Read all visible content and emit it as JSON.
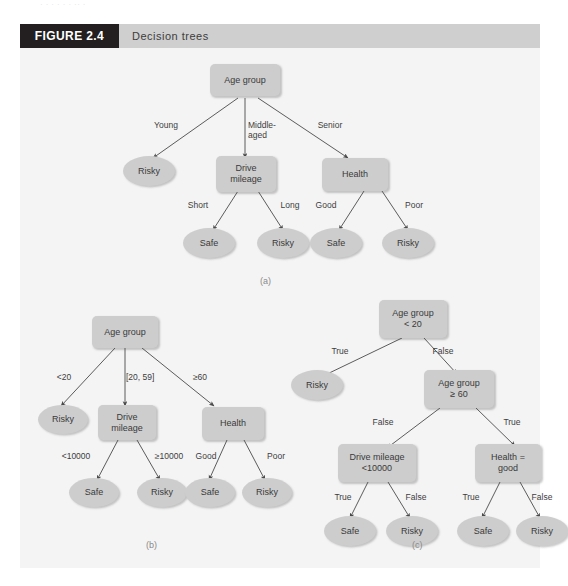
{
  "page": {
    "top_partial_text": "· · ·  ·  · ·   ·· ·"
  },
  "figure": {
    "tag": "FIGURE 2.4",
    "caption": "Decision trees",
    "tag_bg": "#231f20",
    "tag_fg": "#ffffff",
    "bar_bg": "#cfcfcf",
    "body_bg": "#f4f4f4",
    "node_fill": "#cdcdcd",
    "node_text": "#3a3a3a",
    "edge_color": "#4a4a4a"
  },
  "trees": [
    {
      "id": "a",
      "caption": "(a)",
      "nodes": [
        {
          "name": "root",
          "label": "Age group",
          "shape": "rect"
        },
        {
          "name": "risky-young",
          "label": "Risky",
          "shape": "leaf"
        },
        {
          "name": "drive-mileage",
          "label": "Drive\nmileage",
          "shape": "rect"
        },
        {
          "name": "health",
          "label": "Health",
          "shape": "rect"
        },
        {
          "name": "safe-short",
          "label": "Safe",
          "shape": "leaf"
        },
        {
          "name": "risky-long",
          "label": "Risky",
          "shape": "leaf"
        },
        {
          "name": "safe-good",
          "label": "Safe",
          "shape": "leaf"
        },
        {
          "name": "risky-poor",
          "label": "Risky",
          "shape": "leaf"
        }
      ],
      "edge_labels": [
        {
          "name": "young",
          "label": "Young"
        },
        {
          "name": "middle",
          "label": "Middle-\naged"
        },
        {
          "name": "senior",
          "label": "Senior"
        },
        {
          "name": "short",
          "label": "Short"
        },
        {
          "name": "long",
          "label": "Long"
        },
        {
          "name": "good",
          "label": "Good"
        },
        {
          "name": "poor",
          "label": "Poor"
        }
      ]
    },
    {
      "id": "b",
      "caption": "(b)",
      "nodes": [
        {
          "name": "root",
          "label": "Age group",
          "shape": "rect"
        },
        {
          "name": "risky-young",
          "label": "Risky",
          "shape": "leaf"
        },
        {
          "name": "drive-mileage",
          "label": "Drive\nmileage",
          "shape": "rect"
        },
        {
          "name": "health",
          "label": "Health",
          "shape": "rect"
        },
        {
          "name": "safe-low",
          "label": "Safe",
          "shape": "leaf"
        },
        {
          "name": "risky-high",
          "label": "Risky",
          "shape": "leaf"
        },
        {
          "name": "safe-good",
          "label": "Safe",
          "shape": "leaf"
        },
        {
          "name": "risky-poor",
          "label": "Risky",
          "shape": "leaf"
        }
      ],
      "edge_labels": [
        {
          "name": "under20",
          "label": "<20"
        },
        {
          "name": "range2059",
          "label": "[20, 59]"
        },
        {
          "name": "over60",
          "label": "≥60"
        },
        {
          "name": "under10000",
          "label": "<10000"
        },
        {
          "name": "over10000",
          "label": "≥10000"
        },
        {
          "name": "good",
          "label": "Good"
        },
        {
          "name": "poor",
          "label": "Poor"
        }
      ]
    },
    {
      "id": "c",
      "caption": "(c)",
      "nodes": [
        {
          "name": "root",
          "label": "Age group\n< 20",
          "shape": "rect"
        },
        {
          "name": "risky-true",
          "label": "Risky",
          "shape": "leaf"
        },
        {
          "name": "age-60",
          "label": "Age group\n≥ 60",
          "shape": "rect"
        },
        {
          "name": "drive-mileage",
          "label": "Drive mileage\n<10000",
          "shape": "rect"
        },
        {
          "name": "health-good",
          "label": "Health =\ngood",
          "shape": "rect"
        },
        {
          "name": "safe-left",
          "label": "Safe",
          "shape": "leaf"
        },
        {
          "name": "risky-left",
          "label": "Risky",
          "shape": "leaf"
        },
        {
          "name": "safe-right",
          "label": "Safe",
          "shape": "leaf"
        },
        {
          "name": "risky-right",
          "label": "Risky",
          "shape": "leaf"
        }
      ],
      "edge_labels": [
        {
          "name": "root-true",
          "label": "True"
        },
        {
          "name": "root-false",
          "label": "False"
        },
        {
          "name": "age60-false",
          "label": "False"
        },
        {
          "name": "age60-true",
          "label": "True"
        },
        {
          "name": "dm-true",
          "label": "True"
        },
        {
          "name": "dm-false",
          "label": "False"
        },
        {
          "name": "hg-true",
          "label": "True"
        },
        {
          "name": "hg-false",
          "label": "False"
        }
      ]
    }
  ]
}
